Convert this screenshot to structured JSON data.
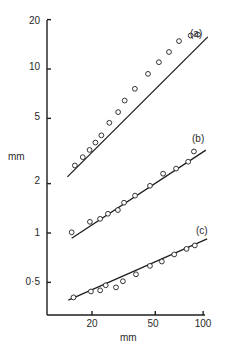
{
  "chart_data": {
    "type": "scatter",
    "title": "",
    "xlabel": "mm",
    "ylabel": "mm",
    "xscale": "log",
    "yscale": "log",
    "xlim": [
      12,
      110
    ],
    "ylim": [
      0.3,
      20
    ],
    "x_ticks": [
      20,
      50,
      100
    ],
    "x_tick_labels": [
      "20",
      "50",
      "100"
    ],
    "y_ticks": [
      0.5,
      1,
      2,
      5,
      10,
      20
    ],
    "y_tick_labels": [
      "0·5",
      "1",
      "2",
      "5",
      "10",
      "20"
    ],
    "grid": false,
    "legend": "none",
    "series": [
      {
        "name": "(a)",
        "marker": "open-circle",
        "fit_line": {
          "x": [
            14.0,
            107.0
          ],
          "y": [
            2.2,
            15.7
          ]
        },
        "x": [
          15.6,
          17.5,
          19.3,
          21.0,
          22.9,
          25.7,
          29.2,
          32.1,
          37.2,
          45.0,
          52.7,
          61.0,
          70.5,
          83.5,
          92.8
        ],
        "y": [
          2.58,
          2.9,
          3.21,
          3.56,
          3.94,
          4.7,
          5.46,
          6.42,
          7.57,
          9.34,
          11.0,
          12.7,
          14.8,
          16.0,
          16.2
        ]
      },
      {
        "name": "(b)",
        "marker": "open-circle",
        "fit_line": {
          "x": [
            14.9,
            104.0
          ],
          "y": [
            0.93,
            3.2
          ]
        },
        "x": [
          14.9,
          19.4,
          22.5,
          25.2,
          29.1,
          31.8,
          37.3,
          46.3,
          56.0,
          67.6,
          80.5,
          87.5
        ],
        "y": [
          1.01,
          1.17,
          1.22,
          1.31,
          1.38,
          1.53,
          1.69,
          1.94,
          2.3,
          2.47,
          2.72,
          3.14
        ]
      },
      {
        "name": "(c)",
        "marker": "open-circle",
        "fit_line": {
          "x": [
            14.2,
            106.0
          ],
          "y": [
            0.39,
            0.92
          ]
        },
        "x": [
          15.3,
          19.7,
          22.5,
          24.4,
          28.3,
          31.3,
          37.8,
          46.3,
          55.0,
          65.8,
          78.6,
          88.7
        ],
        "y": [
          0.405,
          0.44,
          0.447,
          0.48,
          0.466,
          0.508,
          0.56,
          0.63,
          0.67,
          0.74,
          0.8,
          0.84
        ]
      }
    ],
    "annotations": [
      "(a)",
      "(b)",
      "(c)"
    ]
  },
  "labels": {
    "y_axis": "mm",
    "x_axis": "mm",
    "series_a": "(a)",
    "series_b": "(b)",
    "series_c": "(c)",
    "yt_20": "20",
    "yt_10": "10",
    "yt_5": "5",
    "yt_2": "2",
    "yt_1": "1",
    "yt_05": "0·5",
    "xt_20": "20",
    "xt_50": "50",
    "xt_100": "100"
  },
  "colors": {
    "ink": "#1e1e1e",
    "background": "#ffffff"
  }
}
